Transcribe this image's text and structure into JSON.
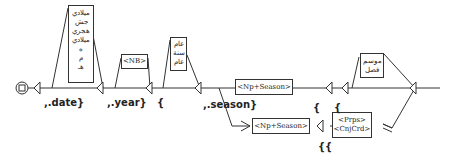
{
  "graph": {
    "initial_state": "initial-node",
    "boxes": {
      "date_words": {
        "lines": [
          "ميلادي",
          "جش",
          "هجري",
          "ميلادي",
          "ه",
          "م",
          "هـ"
        ]
      },
      "nb": {
        "lines": [
          "<NB>"
        ]
      },
      "year_words": {
        "lines": [
          "عام",
          "سنة",
          "عام"
        ]
      },
      "np_season_top": {
        "lines": [
          "<Np+Season>"
        ]
      },
      "np_season_bottom": {
        "lines": [
          "<Np+Season>"
        ]
      },
      "season_words": {
        "lines": [
          "موسم",
          "فصل"
        ]
      },
      "prep_conj": {
        "lines": [
          "<Prps>",
          "<CnjCrd>"
        ]
      }
    },
    "outputs": {
      "date": ",.date}",
      "year": ",.year}",
      "brace_year": "{",
      "season": ",.season}",
      "brace_1": "{",
      "brace_2": "{",
      "double_brace": "{{"
    }
  }
}
